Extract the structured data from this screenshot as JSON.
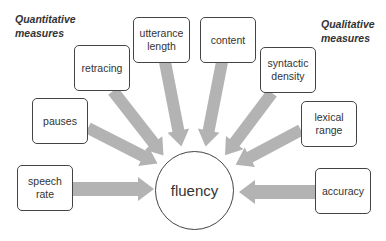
{
  "diagram": {
    "headings": {
      "left": "Quantitative\nmeasures",
      "right": "Qualitative\nmeasures"
    },
    "center": {
      "label": "fluency"
    },
    "quantitative_measures": [
      {
        "id": "speech-rate",
        "label": "speech\nrate"
      },
      {
        "id": "pauses",
        "label": "pauses"
      },
      {
        "id": "retracing",
        "label": "retracing"
      },
      {
        "id": "utterance-length",
        "label": "utterance\nlength"
      }
    ],
    "qualitative_measures": [
      {
        "id": "content",
        "label": "content"
      },
      {
        "id": "syntactic-density",
        "label": "syntactic\ndensity"
      },
      {
        "id": "lexical-range",
        "label": "lexical\nrange"
      },
      {
        "id": "accuracy",
        "label": "accuracy"
      }
    ],
    "colors": {
      "arrow": "#b3b3b3",
      "border": "#444444",
      "text": "#333333"
    }
  }
}
